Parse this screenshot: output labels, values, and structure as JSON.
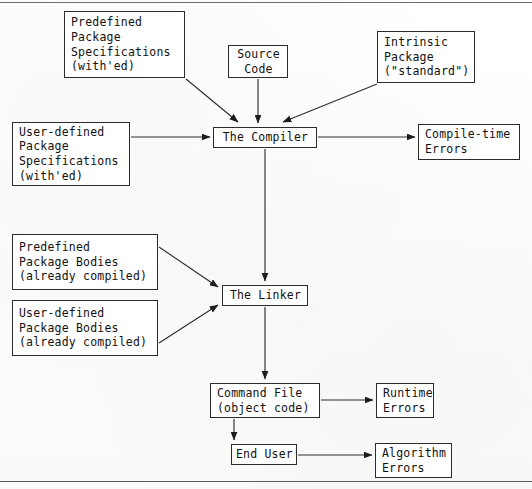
{
  "document": {
    "title": "Ada Compilation and Linking Process",
    "background_color": "#fdfdfb",
    "ink_color": "#111111",
    "rule_color": "#5a5a5a"
  },
  "nodes": [
    {
      "id": "predefined-package-specifications",
      "lines": [
        "Predefined",
        "Package",
        "Specifications",
        "(with'ed)"
      ],
      "x": 64,
      "y": 11,
      "w": 121,
      "h": 67,
      "align": "left"
    },
    {
      "id": "source-code",
      "lines": [
        "Source",
        "Code"
      ],
      "x": 228,
      "y": 45,
      "w": 60,
      "h": 33,
      "align": "center"
    },
    {
      "id": "intrinsic-package",
      "lines": [
        "Intrinsic",
        "Package",
        "(\"standard\")"
      ],
      "x": 377,
      "y": 31,
      "w": 98,
      "h": 52,
      "align": "left"
    },
    {
      "id": "user-defined-package-specifications",
      "lines": [
        "User-defined",
        "Package",
        "Specifications",
        "(with'ed)"
      ],
      "x": 12,
      "y": 122,
      "w": 118,
      "h": 64,
      "align": "left"
    },
    {
      "id": "the-compiler",
      "lines": [
        "The Compiler"
      ],
      "x": 213,
      "y": 127,
      "w": 104,
      "h": 21,
      "align": "center"
    },
    {
      "id": "compile-time-errors",
      "lines": [
        "Compile-time",
        "Errors"
      ],
      "x": 418,
      "y": 124,
      "w": 102,
      "h": 36,
      "align": "left"
    },
    {
      "id": "predefined-package-bodies",
      "lines": [
        "Predefined",
        "Package Bodies",
        "(already compiled)"
      ],
      "x": 12,
      "y": 234,
      "w": 146,
      "h": 56,
      "align": "left"
    },
    {
      "id": "user-defined-package-bodies",
      "lines": [
        "User-defined",
        "Package Bodies",
        "(already compiled)"
      ],
      "x": 12,
      "y": 300,
      "w": 146,
      "h": 56,
      "align": "left"
    },
    {
      "id": "the-linker",
      "lines": [
        "The Linker"
      ],
      "x": 222,
      "y": 285,
      "w": 86,
      "h": 21,
      "align": "center"
    },
    {
      "id": "command-file",
      "lines": [
        "Command File",
        "(object code)"
      ],
      "x": 210,
      "y": 383,
      "w": 110,
      "h": 35,
      "align": "left"
    },
    {
      "id": "runtime-errors",
      "lines": [
        "Runtime",
        "Errors"
      ],
      "x": 376,
      "y": 383,
      "w": 58,
      "h": 35,
      "align": "left"
    },
    {
      "id": "end-user",
      "lines": [
        "End User"
      ],
      "x": 231,
      "y": 444,
      "w": 66,
      "h": 21,
      "align": "center"
    },
    {
      "id": "algorithm-errors",
      "lines": [
        "Algorithm",
        "Errors"
      ],
      "x": 375,
      "y": 443,
      "w": 77,
      "h": 35,
      "align": "left"
    }
  ],
  "edges": [
    {
      "id": "predefined-specs-to-compiler",
      "from": "predefined-package-specifications",
      "to": "the-compiler",
      "kind": "diagonal",
      "x1": 186,
      "y1": 79,
      "x2": 238,
      "y2": 122
    },
    {
      "id": "source-code-to-compiler",
      "from": "source-code",
      "to": "the-compiler",
      "kind": "vertical",
      "x1": 258,
      "y1": 79,
      "x2": 258,
      "y2": 123
    },
    {
      "id": "intrinsic-package-to-compiler",
      "from": "intrinsic-package",
      "to": "the-compiler",
      "kind": "diagonal",
      "x1": 377,
      "y1": 84,
      "x2": 283,
      "y2": 122
    },
    {
      "id": "user-defined-specs-to-compiler",
      "from": "user-defined-package-specifications",
      "to": "the-compiler",
      "kind": "horizontal",
      "x1": 131,
      "y1": 137,
      "x2": 210,
      "y2": 137
    },
    {
      "id": "compiler-to-compile-time-errors",
      "from": "the-compiler",
      "to": "compile-time-errors",
      "kind": "horizontal",
      "x1": 318,
      "y1": 137,
      "x2": 415,
      "y2": 137
    },
    {
      "id": "compiler-to-linker",
      "from": "the-compiler",
      "to": "the-linker",
      "kind": "vertical",
      "x1": 265,
      "y1": 149,
      "x2": 265,
      "y2": 281
    },
    {
      "id": "predefined-bodies-to-linker",
      "from": "predefined-package-bodies",
      "to": "the-linker",
      "kind": "diagonal",
      "x1": 159,
      "y1": 247,
      "x2": 218,
      "y2": 287
    },
    {
      "id": "user-defined-bodies-to-linker",
      "from": "user-defined-package-bodies",
      "to": "the-linker",
      "kind": "diagonal",
      "x1": 159,
      "y1": 343,
      "x2": 218,
      "y2": 305
    },
    {
      "id": "linker-to-command-file",
      "from": "the-linker",
      "to": "command-file",
      "kind": "vertical",
      "x1": 265,
      "y1": 307,
      "x2": 265,
      "y2": 379
    },
    {
      "id": "command-file-to-runtime-errors",
      "from": "command-file",
      "to": "runtime-errors",
      "kind": "horizontal",
      "x1": 321,
      "y1": 400,
      "x2": 373,
      "y2": 400
    },
    {
      "id": "command-file-to-end-user",
      "from": "command-file",
      "to": "end-user",
      "kind": "vertical",
      "x1": 234,
      "y1": 419,
      "x2": 234,
      "y2": 440
    },
    {
      "id": "end-user-to-algorithm-errors",
      "from": "end-user",
      "to": "algorithm-errors",
      "kind": "horizontal",
      "x1": 298,
      "y1": 455,
      "x2": 372,
      "y2": 455
    }
  ],
  "rules": [
    {
      "id": "top-rule",
      "y": 2
    },
    {
      "id": "bottom-rule",
      "y": 481
    }
  ]
}
